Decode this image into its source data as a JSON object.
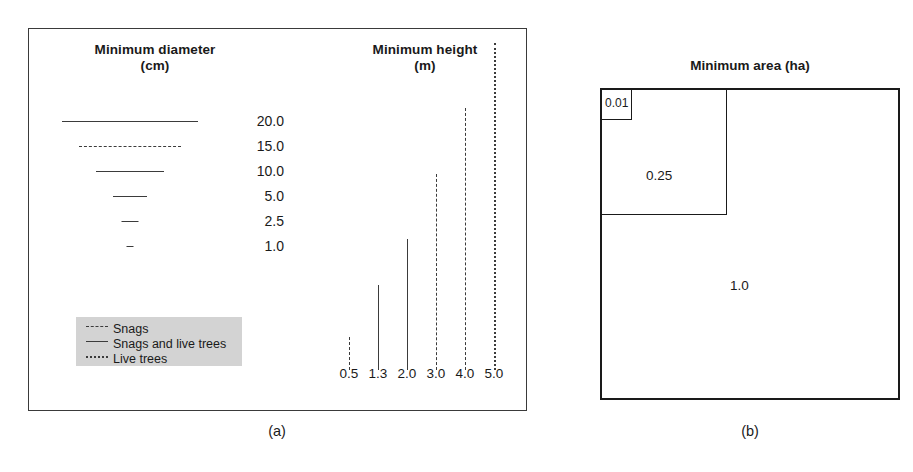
{
  "figure": {
    "panels": [
      {
        "caption": "(a)"
      },
      {
        "caption": "(b)"
      }
    ]
  },
  "panel_a": {
    "diameter": {
      "title_line1": "Minimum diameter",
      "title_line2": "(cm)",
      "unit": "cm",
      "rows": [
        {
          "value": "20.0",
          "length_px": 136,
          "style": "solid",
          "type": "snags-and-live-trees"
        },
        {
          "value": "15.0",
          "length_px": 102,
          "style": "dashed",
          "type": "snags"
        },
        {
          "value": "10.0",
          "length_px": 68,
          "style": "solid",
          "type": "snags-and-live-trees"
        },
        {
          "value": "5.0",
          "length_px": 34,
          "style": "solid",
          "type": "snags-and-live-trees"
        },
        {
          "value": "2.5",
          "length_px": 17,
          "style": "solid",
          "type": "snags-and-live-trees"
        },
        {
          "value": "1.0",
          "length_px": 7,
          "style": "solid",
          "type": "snags-and-live-trees"
        }
      ]
    },
    "height": {
      "title_line1": "Minimum height",
      "title_line2": "(m)",
      "unit": "m",
      "bars": [
        {
          "value": "0.5",
          "height_px": 33,
          "style": "dashed",
          "type": "snags"
        },
        {
          "value": "1.3",
          "height_px": 85,
          "style": "solid",
          "type": "snags-and-live-trees"
        },
        {
          "value": "2.0",
          "height_px": 131,
          "style": "solid",
          "type": "snags-and-live-trees"
        },
        {
          "value": "3.0",
          "height_px": 196,
          "style": "dashed",
          "type": "snags"
        },
        {
          "value": "4.0",
          "height_px": 262,
          "style": "dashed",
          "type": "snags"
        },
        {
          "value": "5.0",
          "height_px": 327,
          "style": "dotted",
          "type": "live-trees"
        }
      ]
    },
    "legend": {
      "background_color": "#d3d3d3",
      "items": [
        {
          "label": "Snags",
          "style": "dashed"
        },
        {
          "label": "Snags and live trees",
          "style": "solid"
        },
        {
          "label": "Live trees",
          "style": "dotted"
        }
      ]
    }
  },
  "panel_b": {
    "title": "Minimum area (ha)",
    "unit": "ha",
    "squares": [
      {
        "value": "0.01",
        "side_px": 30,
        "label_x": 5,
        "label_y": 3
      },
      {
        "value": "0.25",
        "side_px": 125,
        "label_x": 40,
        "label_y": 80
      },
      {
        "value": "1.0",
        "side_px": 296,
        "label_x": 140,
        "label_y": 190
      }
    ]
  },
  "chart_data": {
    "type": "bar",
    "panels": [
      {
        "id": "a",
        "caption": "(a)",
        "subcharts": [
          {
            "title": "Minimum diameter (cm)",
            "orientation": "horizontal",
            "ylabel": "Minimum diameter (cm)",
            "categories": [
              "20.0",
              "15.0",
              "10.0",
              "5.0",
              "2.5",
              "1.0"
            ],
            "values": [
              20.0,
              15.0,
              10.0,
              5.0,
              2.5,
              1.0
            ],
            "line_styles": [
              "solid",
              "dashed",
              "solid",
              "solid",
              "solid",
              "solid"
            ],
            "series_by_style": {
              "solid": "Snags and live trees",
              "dashed": "Snags",
              "dotted": "Live trees"
            }
          },
          {
            "title": "Minimum height (m)",
            "orientation": "vertical",
            "xlabel": "Minimum height (m)",
            "categories": [
              "0.5",
              "1.3",
              "2.0",
              "3.0",
              "4.0",
              "5.0"
            ],
            "values": [
              0.5,
              1.3,
              2.0,
              3.0,
              4.0,
              5.0
            ],
            "line_styles": [
              "dashed",
              "solid",
              "solid",
              "dashed",
              "dashed",
              "dotted"
            ],
            "ylim": [
              0,
              5.0
            ],
            "grid": false
          }
        ],
        "legend": {
          "position": "bottom-left",
          "entries": [
            "Snags",
            "Snags and live trees",
            "Live trees"
          ]
        }
      },
      {
        "id": "b",
        "caption": "(b)",
        "title": "Minimum area (ha)",
        "type": "nested-squares",
        "categories": [
          "0.01",
          "0.25",
          "1.0"
        ],
        "values": [
          0.01,
          0.25,
          1.0
        ],
        "note": "Nested squares scaled by square root of area"
      }
    ]
  }
}
